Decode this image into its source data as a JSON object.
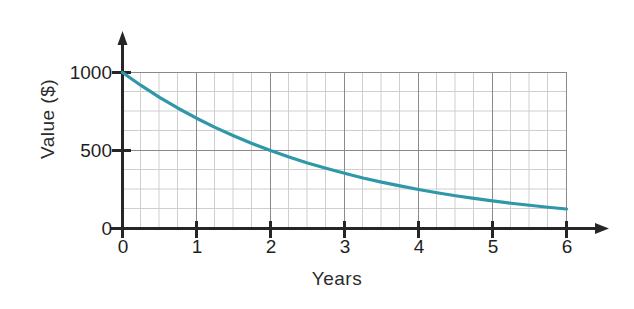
{
  "chart_data": {
    "type": "line",
    "title": "",
    "subtitle": "",
    "xlabel": "Years",
    "ylabel": "Value ($)",
    "xlim": [
      0,
      6
    ],
    "ylim": [
      0,
      1000
    ],
    "xticks": [
      "0",
      "1",
      "2",
      "3",
      "4",
      "5",
      "6"
    ],
    "xtick_values": [
      0,
      1,
      2,
      3,
      4,
      5,
      6
    ],
    "yticks": [
      "0",
      "500",
      "1000"
    ],
    "ytick_values": [
      0,
      500,
      1000
    ],
    "grid": "major and minor",
    "grid_minor_x_step": 0.25,
    "grid_minor_y_step": 125,
    "legend": "none",
    "axis_arrows": "x-right, y-up",
    "series": [
      {
        "name": "Value",
        "color": "#2e97a8",
        "x": [
          0,
          0.25,
          0.5,
          0.75,
          1,
          1.25,
          1.5,
          1.75,
          2,
          2.25,
          2.5,
          2.75,
          3,
          3.25,
          3.5,
          3.75,
          4,
          4.25,
          4.5,
          4.75,
          5,
          5.25,
          5.5,
          5.75,
          6
        ],
        "values": [
          1000,
          917,
          841,
          771,
          707,
          648,
          595,
          545,
          500,
          459,
          420,
          386,
          354,
          324,
          297,
          273,
          250,
          229,
          210,
          193,
          177,
          162,
          149,
          136,
          125
        ]
      }
    ],
    "annotations": []
  },
  "colors": {
    "curve": "#2e97a8",
    "axis": "#262626",
    "grid_major": "#7b7b7b",
    "grid_minor": "#c9c9c9",
    "text": "#232323",
    "background": "#ffffff"
  },
  "axis_labels": {
    "y": "Value ($)",
    "x": "Years"
  },
  "x_ticks": [
    {
      "label": "0"
    },
    {
      "label": "1"
    },
    {
      "label": "2"
    },
    {
      "label": "3"
    },
    {
      "label": "4"
    },
    {
      "label": "5"
    },
    {
      "label": "6"
    }
  ],
  "y_ticks": [
    {
      "label": "1000"
    },
    {
      "label": "500"
    },
    {
      "label": "0"
    }
  ]
}
